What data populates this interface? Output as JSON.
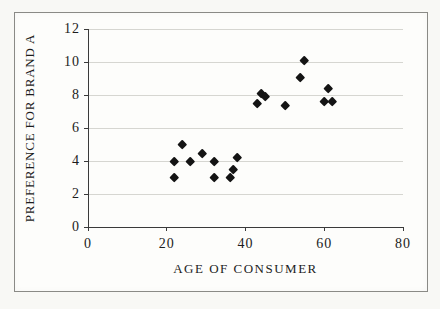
{
  "chart_data": {
    "type": "scatter",
    "title": "",
    "xlabel": "AGE OF CONSUMER",
    "ylabel": "PREFERENCE FOR BRAND A",
    "xlim": [
      0,
      80
    ],
    "ylim": [
      0,
      12
    ],
    "x_ticks": [
      0,
      20,
      40,
      60,
      80
    ],
    "y_ticks": [
      0,
      2,
      4,
      6,
      8,
      10,
      12
    ],
    "grid": "horizontal-major-only",
    "legend": "none",
    "marker": {
      "shape": "filled-diamond",
      "color": "#141414",
      "size_px": 8
    },
    "points": [
      {
        "x": 22,
        "y": 4.0
      },
      {
        "x": 22,
        "y": 3.0
      },
      {
        "x": 24,
        "y": 5.0
      },
      {
        "x": 26,
        "y": 4.0
      },
      {
        "x": 29,
        "y": 4.5
      },
      {
        "x": 32,
        "y": 4.0
      },
      {
        "x": 32,
        "y": 3.0
      },
      {
        "x": 36,
        "y": 3.0
      },
      {
        "x": 37,
        "y": 3.5
      },
      {
        "x": 38,
        "y": 4.2
      },
      {
        "x": 43,
        "y": 7.5
      },
      {
        "x": 44,
        "y": 8.1
      },
      {
        "x": 45,
        "y": 7.9
      },
      {
        "x": 50,
        "y": 7.4
      },
      {
        "x": 54,
        "y": 9.1
      },
      {
        "x": 55,
        "y": 10.1
      },
      {
        "x": 60,
        "y": 7.6
      },
      {
        "x": 61,
        "y": 8.4
      },
      {
        "x": 62,
        "y": 7.6
      }
    ],
    "colors": {
      "page_bg": "#f8f8f5",
      "chart_bg": "#fdfdfb",
      "frame_border": "#8a8a86",
      "gridline": "#d6d6d1",
      "axis": "#3a3a3a",
      "text": "#1c1c1c"
    }
  }
}
